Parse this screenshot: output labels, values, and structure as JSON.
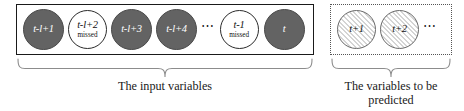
{
  "figure": {
    "type": "time-series-window-diagram",
    "groups": [
      {
        "id": "input",
        "border_style": "solid",
        "caption_lines": [
          "The input variables"
        ],
        "nodes": [
          {
            "label": "t-l+1",
            "sublabel": "",
            "state": "observed"
          },
          {
            "label": "t-l+2",
            "sublabel": "missed",
            "state": "missed"
          },
          {
            "label": "t-l+3",
            "sublabel": "",
            "state": "observed"
          },
          {
            "label": "t-l+4",
            "sublabel": "",
            "state": "observed"
          },
          {
            "label": "⋯",
            "sublabel": "",
            "state": "ellipsis"
          },
          {
            "label": "t-1",
            "sublabel": "missed",
            "state": "missed"
          },
          {
            "label": "t",
            "sublabel": "",
            "state": "observed"
          }
        ]
      },
      {
        "id": "predict",
        "border_style": "dotted",
        "caption_lines": [
          "The variables to be",
          "predicted"
        ],
        "nodes": [
          {
            "label": "t+1",
            "sublabel": "",
            "state": "future"
          },
          {
            "label": "t+2",
            "sublabel": "",
            "state": "future"
          },
          {
            "label": "⋯",
            "sublabel": "",
            "state": "ellipsis"
          }
        ]
      }
    ]
  },
  "colors": {
    "observed_fill": "#636363",
    "observed_text": "#ffffff",
    "missed_fill": "#ffffff",
    "missed_text": "#111111",
    "future_fill": "#f2f2f2",
    "future_hatch": "#d4d4d4",
    "box_border": "#1a1a1a",
    "dotted_border": "#555555",
    "brace": "#8c8c8c",
    "caption_text": "#1a1a1a"
  }
}
